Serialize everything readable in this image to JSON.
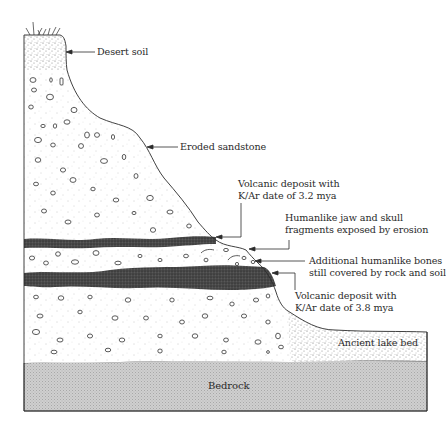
{
  "figure": {
    "type": "geologic-cross-section",
    "layers": [
      {
        "id": "desert-soil",
        "label": "Desert soil"
      },
      {
        "id": "eroded-sandstone",
        "label": "Eroded sandstone"
      },
      {
        "id": "volcanic-upper",
        "label_line1": "Volcanic deposit with",
        "label_line2": "K/Ar date of 3.2 mya"
      },
      {
        "id": "volcanic-lower",
        "label_line1": "Volcanic deposit with",
        "label_line2": "K/Ar date of 3.8 mya"
      },
      {
        "id": "ancient-lake-bed",
        "label": "Ancient lake bed"
      },
      {
        "id": "bedrock",
        "label": "Bedrock"
      }
    ],
    "annotations": [
      {
        "id": "jaw-skull",
        "label_line1": "Humanlike jaw and skull",
        "label_line2": "fragments exposed by erosion"
      },
      {
        "id": "additional-bones",
        "label_line1": "Additional humanlike bones",
        "label_line2": "still covered by rock and soil"
      }
    ],
    "colors": {
      "outline": "#2b2b2b",
      "volcanic": "#3a3a3a",
      "bedrock": "#c4c4c4",
      "soil_stipple": "#7a7a7a",
      "background": "#ffffff"
    }
  }
}
